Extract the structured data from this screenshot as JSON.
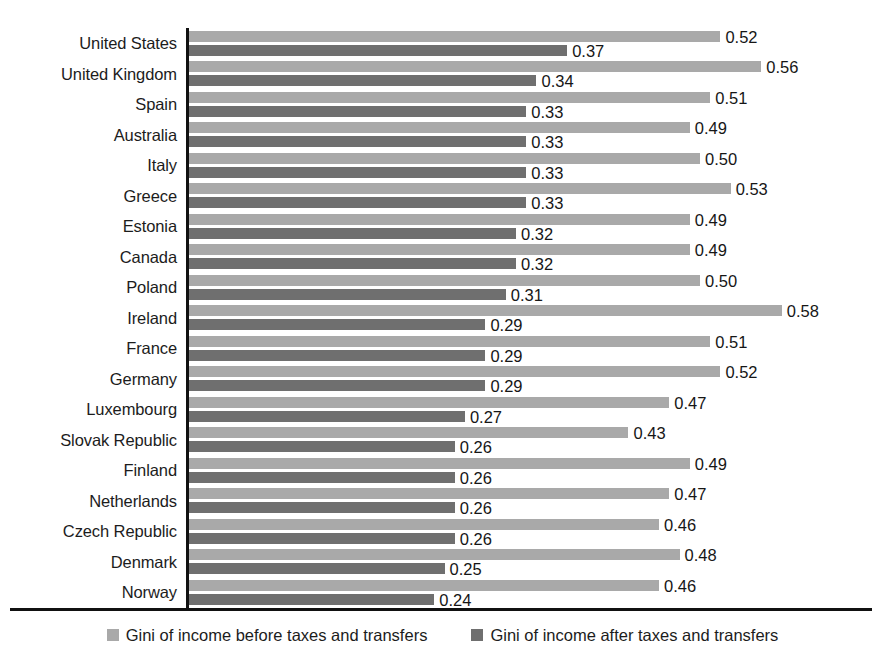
{
  "chart_data": {
    "type": "bar",
    "orientation": "horizontal",
    "title": "",
    "subtitle": "",
    "xlabel": "",
    "ylabel": "",
    "xlim": [
      0,
      0.62
    ],
    "grid": false,
    "legend_position": "bottom",
    "value_format": "0.00",
    "categories": [
      "United States",
      "United Kingdom",
      "Spain",
      "Australia",
      "Italy",
      "Greece",
      "Estonia",
      "Canada",
      "Poland",
      "Ireland",
      "France",
      "Germany",
      "Luxembourg",
      "Slovak Republic",
      "Finland",
      "Netherlands",
      "Czech Republic",
      "Denmark",
      "Norway"
    ],
    "series": [
      {
        "name": "Gini of income before taxes and transfers",
        "color": "#a9a9a9",
        "values": [
          0.52,
          0.56,
          0.51,
          0.49,
          0.5,
          0.53,
          0.49,
          0.49,
          0.5,
          0.58,
          0.51,
          0.52,
          0.47,
          0.43,
          0.49,
          0.47,
          0.46,
          0.48,
          0.46
        ],
        "labels": [
          "0.52",
          "0.56",
          "0.51",
          "0.49",
          "0.50",
          "0.53",
          "0.49",
          "0.49",
          "0.50",
          "0.58",
          "0.51",
          "0.52",
          "0.47",
          "0.43",
          "0.49",
          "0.47",
          "0.46",
          "0.48",
          "0.46"
        ]
      },
      {
        "name": "Gini of income after taxes and transfers",
        "color": "#6f6f6f",
        "values": [
          0.37,
          0.34,
          0.33,
          0.33,
          0.33,
          0.33,
          0.32,
          0.32,
          0.31,
          0.29,
          0.29,
          0.29,
          0.27,
          0.26,
          0.26,
          0.26,
          0.26,
          0.25,
          0.24
        ],
        "labels": [
          "0.37",
          "0.34",
          "0.33",
          "0.33",
          "0.33",
          "0.33",
          "0.32",
          "0.32",
          "0.31",
          "0.29",
          "0.29",
          "0.29",
          "0.27",
          "0.26",
          "0.26",
          "0.26",
          "0.26",
          "0.25",
          "0.24"
        ]
      }
    ]
  },
  "legend": {
    "items": [
      {
        "label": "Gini of income before taxes and transfers",
        "color": "#a9a9a9"
      },
      {
        "label": "Gini of income after taxes and transfers",
        "color": "#6f6f6f"
      }
    ]
  }
}
